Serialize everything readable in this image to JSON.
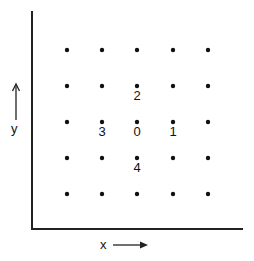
{
  "diagram": {
    "type": "lattice-neighborhood",
    "axes": {
      "x_label": "x",
      "y_label": "y",
      "x_arrow": "right",
      "y_arrow": "up",
      "color": "#222222"
    },
    "grid": {
      "rows": 5,
      "cols": 5,
      "dot_color": "#111111",
      "col_x": [
        67,
        102,
        137,
        173,
        208
      ],
      "row_y": [
        50,
        86,
        122,
        158,
        194
      ]
    },
    "labeled_points": [
      {
        "label": "0",
        "col": 2,
        "row": 2
      },
      {
        "label": "1",
        "col": 3,
        "row": 2
      },
      {
        "label": "2",
        "col": 2,
        "row": 1
      },
      {
        "label": "3",
        "col": 1,
        "row": 2
      },
      {
        "label": "4",
        "col": 2,
        "row": 3
      }
    ]
  }
}
